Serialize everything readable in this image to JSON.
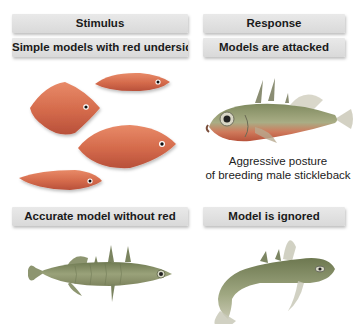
{
  "left_column": {
    "header": "Stimulus",
    "top_panel": {
      "title": "Simple models with red undersides",
      "models": [
        {
          "shape": "small-elongated",
          "color": "#d9684a"
        },
        {
          "shape": "rhombus",
          "color": "#d9684a"
        },
        {
          "shape": "large-oval",
          "color": "#d9684a"
        },
        {
          "shape": "long-thin",
          "color": "#d9684a"
        }
      ]
    },
    "bottom_panel": {
      "title": "Accurate model without red",
      "figure": "stickleback-model-no-red"
    }
  },
  "right_column": {
    "header": "Response",
    "top_panel": {
      "title": "Models are attacked",
      "figure": "aggressive-male-stickleback",
      "caption_line1": "Aggressive posture",
      "caption_line2": "of breeding male stickleback"
    },
    "bottom_panel": {
      "title": "Model is ignored",
      "figure": "curved-stickleback-ignoring"
    }
  },
  "colors": {
    "header_bg": "#dedede",
    "model_red": "#d9684a",
    "fish_olive": "#8f9a6a",
    "fish_belly_red": "#c95a3e"
  }
}
